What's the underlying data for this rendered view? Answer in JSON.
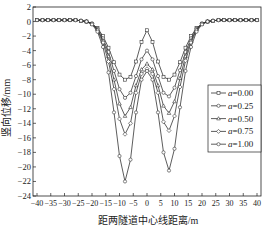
{
  "chart_data": {
    "type": "line",
    "title": "",
    "xlabel": "距两隧道中心线距离/m",
    "ylabel": "竖向位移/mm",
    "xlim": [
      -40,
      40
    ],
    "ylim": [
      -24,
      2
    ],
    "xticks": [
      -40,
      -35,
      -30,
      -25,
      -20,
      -15,
      -10,
      -5,
      0,
      5,
      10,
      15,
      20,
      25,
      30,
      35,
      40
    ],
    "yticks": [
      2,
      0,
      -2,
      -4,
      -6,
      -8,
      -10,
      -12,
      -14,
      -16,
      -18,
      -20,
      -22,
      -24
    ],
    "grid": false,
    "legend_position": "right-middle",
    "x": [
      -40,
      -38,
      -36,
      -34,
      -32,
      -30,
      -28,
      -26,
      -24,
      -22,
      -20,
      -18,
      -16,
      -14,
      -12,
      -10,
      -8,
      -6,
      -4,
      -2,
      0,
      2,
      4,
      6,
      8,
      10,
      12,
      14,
      16,
      18,
      20,
      22,
      24,
      26,
      28,
      30,
      32,
      34,
      36,
      38,
      40
    ],
    "series": [
      {
        "name": "a=0.00",
        "marker": "square",
        "values": [
          0.2,
          0.2,
          0.2,
          0.2,
          0.2,
          0.2,
          0.2,
          0.2,
          0.1,
          0.0,
          -0.3,
          -0.9,
          -2.0,
          -3.6,
          -5.6,
          -7.3,
          -8.0,
          -7.6,
          -5.5,
          -2.8,
          -1.2,
          -2.8,
          -5.5,
          -7.6,
          -8.0,
          -7.3,
          -5.6,
          -3.6,
          -2.0,
          -0.9,
          -0.3,
          0.0,
          0.1,
          0.2,
          0.2,
          0.2,
          0.2,
          0.2,
          0.2,
          0.2,
          0.2
        ]
      },
      {
        "name": "a=0.25",
        "marker": "circle",
        "values": [
          0.2,
          0.2,
          0.2,
          0.2,
          0.2,
          0.2,
          0.2,
          0.2,
          0.1,
          0.0,
          -0.3,
          -1.0,
          -2.3,
          -4.2,
          -6.8,
          -9.3,
          -10.5,
          -9.8,
          -7.5,
          -5.2,
          -4.0,
          -5.2,
          -7.5,
          -9.8,
          -10.3,
          -9.1,
          -6.7,
          -4.2,
          -2.3,
          -1.0,
          -0.3,
          0.0,
          0.1,
          0.2,
          0.2,
          0.2,
          0.2,
          0.2,
          0.2,
          0.2,
          0.2
        ]
      },
      {
        "name": "a=0.50",
        "marker": "triangle",
        "values": [
          0.2,
          0.2,
          0.2,
          0.2,
          0.2,
          0.2,
          0.2,
          0.2,
          0.1,
          0.0,
          -0.3,
          -1.1,
          -2.6,
          -4.8,
          -8.0,
          -11.3,
          -13.0,
          -11.8,
          -8.8,
          -6.6,
          -5.8,
          -6.6,
          -8.8,
          -11.6,
          -12.6,
          -11.0,
          -7.8,
          -4.8,
          -2.6,
          -1.1,
          -0.3,
          0.0,
          0.1,
          0.2,
          0.2,
          0.2,
          0.2,
          0.2,
          0.2,
          0.2,
          0.2
        ]
      },
      {
        "name": "a=0.75",
        "marker": "diamond",
        "values": [
          0.2,
          0.2,
          0.2,
          0.2,
          0.2,
          0.2,
          0.2,
          0.2,
          0.1,
          0.0,
          -0.3,
          -1.2,
          -2.9,
          -5.5,
          -9.3,
          -13.4,
          -15.5,
          -14.0,
          -9.8,
          -7.2,
          -6.5,
          -7.2,
          -9.8,
          -13.8,
          -15.0,
          -13.0,
          -9.0,
          -5.4,
          -2.9,
          -1.2,
          -0.3,
          0.0,
          0.1,
          0.2,
          0.2,
          0.2,
          0.2,
          0.2,
          0.2,
          0.2,
          0.2
        ]
      },
      {
        "name": "a=1.00",
        "marker": "circle-open",
        "values": [
          0.2,
          0.2,
          0.2,
          0.2,
          0.2,
          0.2,
          0.2,
          0.2,
          0.1,
          0.0,
          -0.4,
          -1.4,
          -3.5,
          -7.0,
          -12.5,
          -18.5,
          -22.0,
          -19.0,
          -12.5,
          -8.0,
          -6.8,
          -8.0,
          -12.5,
          -18.0,
          -20.5,
          -17.5,
          -11.8,
          -6.8,
          -3.5,
          -1.4,
          -0.4,
          0.0,
          0.1,
          0.2,
          0.2,
          0.2,
          0.2,
          0.2,
          0.2,
          0.2,
          0.2
        ]
      }
    ]
  },
  "legend": {
    "items": [
      "a=0.00",
      "a=0.25",
      "a=0.50",
      "a=0.75",
      "a=1.00"
    ]
  },
  "colors": {
    "line": "#333333",
    "axis": "#222222",
    "background": "#ffffff"
  }
}
